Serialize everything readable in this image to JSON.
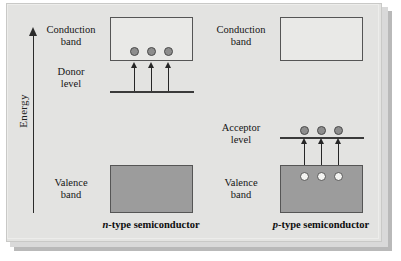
{
  "figure": {
    "axis": {
      "label": "Energy",
      "arrow_direction": "up"
    },
    "panels": [
      {
        "id": "n-type",
        "caption_prefix": "n",
        "caption_rest": "-type semiconductor",
        "caption_full": "n-type semiconductor",
        "labels": {
          "conduction": "Conduction\nband",
          "conduction_line1": "Conduction",
          "conduction_line2": "band",
          "dopant_line1": "Donor",
          "dopant_line2": "level",
          "valence_line1": "Valence",
          "valence_line2": "band"
        },
        "conduction_band": {
          "filled": false,
          "carriers": 3,
          "carrier_type": "electron"
        },
        "dopant_level": {
          "name": "donor level",
          "carriers": 0
        },
        "valence_band": {
          "filled": true,
          "carriers": 0
        },
        "arrows": {
          "count": 3,
          "direction": "up",
          "from": "donor level",
          "to": "conduction band"
        }
      },
      {
        "id": "p-type",
        "caption_prefix": "p",
        "caption_rest": "-type semiconductor",
        "caption_full": "p-type semiconductor",
        "labels": {
          "conduction_line1": "Conduction",
          "conduction_line2": "band",
          "dopant_line1": "Acceptor",
          "dopant_line2": "level",
          "valence_line1": "Valence",
          "valence_line2": "band"
        },
        "conduction_band": {
          "filled": false,
          "carriers": 0
        },
        "dopant_level": {
          "name": "acceptor level",
          "carriers": 3,
          "carrier_type": "electron"
        },
        "valence_band": {
          "filled": true,
          "carriers": 3,
          "carrier_type": "hole"
        },
        "arrows": {
          "count": 3,
          "direction": "up",
          "from": "valence band",
          "to": "acceptor level"
        }
      }
    ]
  },
  "colors": {
    "panel_background": "#e3e3e1",
    "filled_band": "#9c9c9c",
    "empty_band": "#e9e9e7",
    "electron": "#8d8d8d",
    "hole": "#f4f4f2",
    "line": "#3a3a3a"
  }
}
